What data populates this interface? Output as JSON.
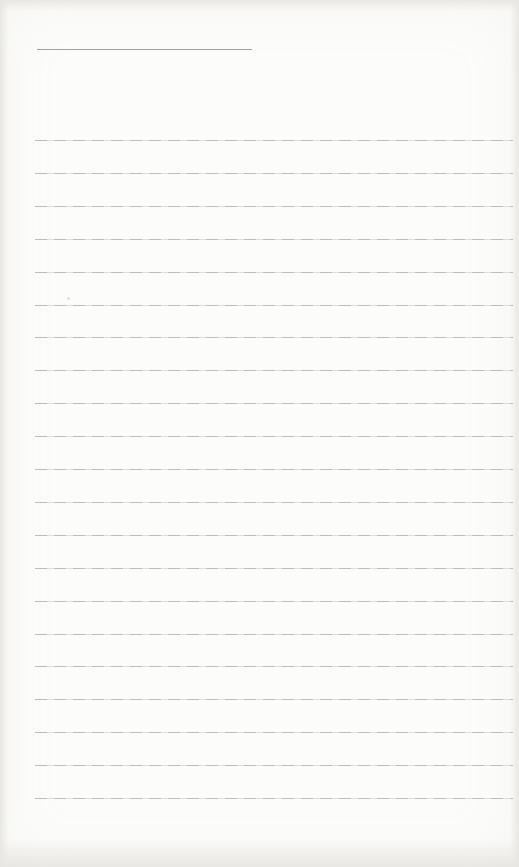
{
  "page": {
    "kind": "blank-ruled-notebook-page",
    "background_color": "#fcfcfb",
    "edge_shade_color": "#dbd9d4",
    "header_underline": {
      "x": 37,
      "y": 49,
      "width": 215,
      "color": "#9a9a9a"
    },
    "ruled_lines": {
      "count": 21,
      "first_y": 140,
      "spacing_y": 32.9,
      "x_start": 35,
      "x_end": 513,
      "color": "#aeaeae"
    },
    "speck": {
      "x": 67,
      "y": 297,
      "color": "#d8d8d4"
    }
  }
}
